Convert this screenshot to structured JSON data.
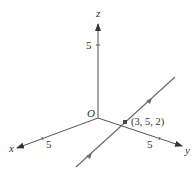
{
  "diagram": {
    "type": "3d-coordinate-axes",
    "axes": {
      "z": {
        "label": "z",
        "tick_label": "5"
      },
      "x": {
        "label": "x",
        "tick_label": "5"
      },
      "y": {
        "label": "y",
        "tick_label": "5"
      }
    },
    "origin_label": "O",
    "point": {
      "label": "(3, 5, 2)"
    },
    "line": {
      "description": "line through point (3, 5, 2) with direction arrows"
    },
    "colors": {
      "axis": "#333333",
      "line": "#6b6b6b",
      "text": "#333333"
    }
  }
}
